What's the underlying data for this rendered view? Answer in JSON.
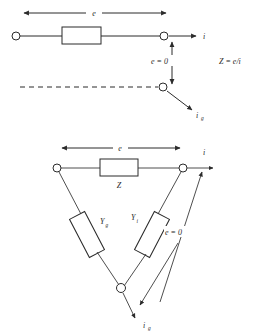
{
  "figure": {
    "ink_color": "#2b2b2b",
    "background_color": "#ffffff"
  },
  "top_diagram": {
    "name": "series-impedance-two-port",
    "dimension_label": "e",
    "box_label": "",
    "current_label": "i",
    "null_label": "e = 0",
    "generator_current_label": "i",
    "generator_current_subscript": "g",
    "relation": "Z = e/i",
    "relation_parts": {
      "symbol": "Z",
      "equals": "=",
      "numerator": "e",
      "slash": "/",
      "denominator": "i"
    },
    "terminals": [
      "left-terminal",
      "right-terminal",
      "lower-terminal"
    ],
    "has_dashed_return": true
  },
  "bottom_diagram": {
    "name": "delta-admittance-network",
    "dimension_label": "e",
    "impedance_label": "Z",
    "left_branch_label": "Y",
    "left_branch_subscript": "g",
    "right_branch_label": "Y",
    "right_branch_subscript": "i",
    "current_label": "i",
    "null_label": "e = 0",
    "generator_current_label": "i",
    "generator_current_subscript": "g",
    "terminals": [
      "left-vertex",
      "right-vertex",
      "bottom-vertex"
    ]
  }
}
